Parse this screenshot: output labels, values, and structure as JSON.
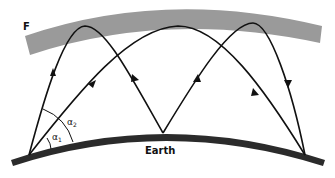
{
  "diagram": {
    "labels": {
      "layer": "F",
      "surface": "Earth",
      "angle1": "α",
      "angle1_sub": "1",
      "angle2": "α",
      "angle2_sub": "2"
    },
    "colors": {
      "layer_fill": "#9a9a9a",
      "earth_fill": "#2b2b2b",
      "ray_stroke": "#111111",
      "background": "#ffffff"
    },
    "rays": [
      {
        "name": "high-angle two-hop path",
        "launch_angle": "α2",
        "hops": 2
      },
      {
        "name": "low-angle single-hop path",
        "launch_angle": "α1",
        "hops": 1
      }
    ]
  }
}
